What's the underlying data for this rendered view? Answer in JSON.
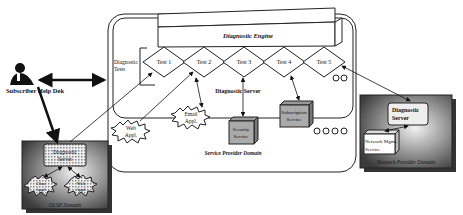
{
  "subscriber": {
    "label": "Subscriber Help Dek"
  },
  "service_provider": {
    "domain_label": "Service Provider Domain",
    "server_label": "Diagnostic Server",
    "engine_label": "Diagnostic Engine",
    "tests_label_1": "Diagnostic",
    "tests_label_2": "Tests",
    "tests": [
      {
        "label": "Test 1"
      },
      {
        "label": "Test 2"
      },
      {
        "label": "Test 3"
      },
      {
        "label": "Test 4"
      },
      {
        "label": "Test 5"
      }
    ],
    "apps": [
      {
        "line1": "Web",
        "line2": "Appl."
      },
      {
        "line1": "Email",
        "line2": "Appl."
      }
    ],
    "services": [
      {
        "line1": "Security",
        "line2": "Service"
      },
      {
        "line1": "Subscription",
        "line2": "Service"
      }
    ]
  },
  "olsp": {
    "domain_label": "OLSP Domain",
    "server_line1": "Diagnostic",
    "server_line2": "Server",
    "apps": [
      {
        "line1": "Chat",
        "line2": "Appl."
      },
      {
        "line1": "Web",
        "line2": "Appl."
      }
    ]
  },
  "network_provider": {
    "domain_label": "Network Provider Domain",
    "server_line1": "Diagnostic",
    "server_line2": "Server",
    "service_line1": "Network Mgmt.",
    "service_line2": "Service"
  }
}
